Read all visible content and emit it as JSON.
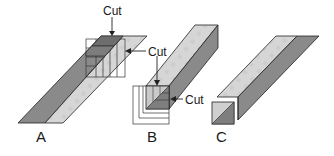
{
  "figure": {
    "colors": {
      "dark_face": "#8a8a8a",
      "light_face": "#d6d6d6",
      "outline": "#222222",
      "background": "#ffffff"
    }
  },
  "panels": [
    {
      "id": "A",
      "label": "A",
      "cut_labels": [
        "Cut",
        "Cut"
      ]
    },
    {
      "id": "B",
      "label": "B",
      "cut_labels": [
        "Cut"
      ]
    },
    {
      "id": "C",
      "label": "C",
      "cut_labels": []
    }
  ],
  "labels": {
    "panel_a": "A",
    "panel_b": "B",
    "panel_c": "C",
    "cut_a_top": "Cut",
    "cut_a_side": "Cut",
    "cut_b": "Cut"
  }
}
